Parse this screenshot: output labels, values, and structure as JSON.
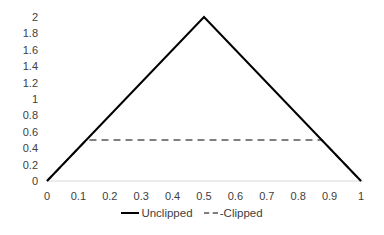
{
  "chart_data": {
    "type": "line",
    "title": "",
    "xlabel": "",
    "ylabel": "",
    "xlim": [
      0,
      1
    ],
    "ylim": [
      0,
      2
    ],
    "x_ticks": [
      "0",
      "0.1",
      "0.2",
      "0.3",
      "0.4",
      "0.5",
      "0.6",
      "0.7",
      "0.8",
      "0.9",
      "1"
    ],
    "y_ticks": [
      "0",
      "0.2",
      "0.4",
      "0.6",
      "0.8",
      "1",
      "1.2",
      "1.4",
      "1.6",
      "1.8",
      "2"
    ],
    "grid": false,
    "legend_position": "bottom",
    "series": [
      {
        "name": "Unclipped",
        "style": "solid",
        "color": "#000000",
        "x": [
          0,
          0.5,
          1
        ],
        "y": [
          0,
          2,
          0
        ]
      },
      {
        "name": "Clipped",
        "style": "dashed",
        "color": "#7f7f7f",
        "x": [
          0,
          0.125,
          0.875,
          1
        ],
        "y": [
          0,
          0.5,
          0.5,
          0
        ]
      }
    ]
  },
  "legend": {
    "unclipped": "Unclipped",
    "clipped": "-Clipped"
  }
}
